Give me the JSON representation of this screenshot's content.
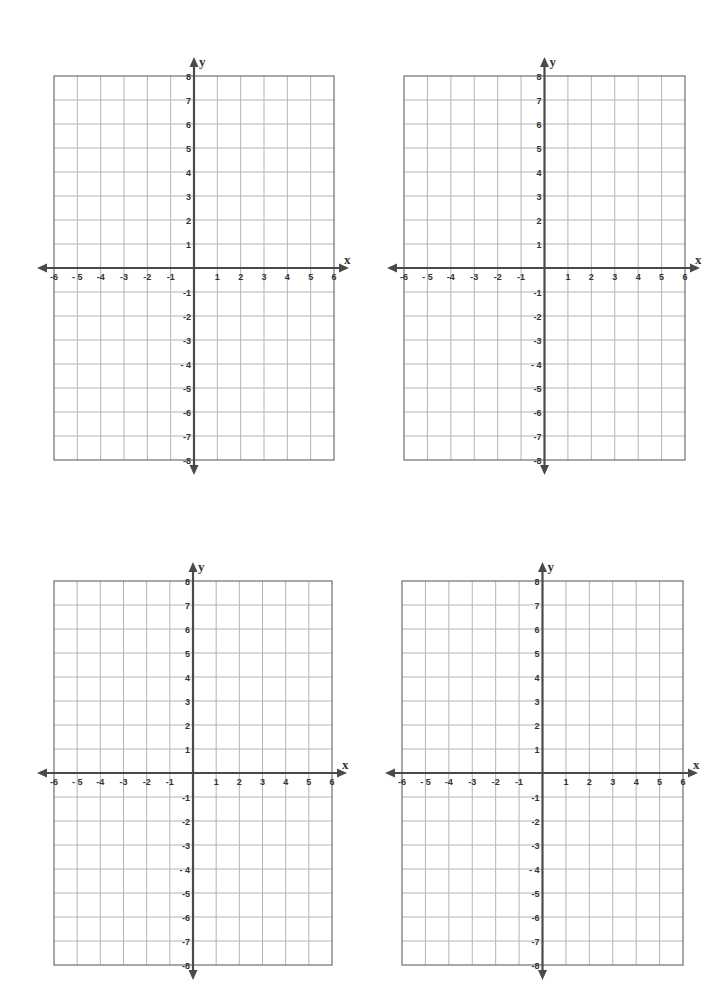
{
  "page": {
    "background": "#ffffff"
  },
  "style": {
    "grid_color": "#b4b4b4",
    "border_color": "#6e6e6e",
    "axis_color": "#4a4a4a",
    "label_color": "#333333"
  },
  "axes": {
    "x_label": "x",
    "y_label": "y",
    "x_min": -6,
    "x_max": 6,
    "y_min": -8,
    "y_max": 8,
    "x_ticks": [
      "-6",
      "- 5",
      "-4",
      "-3",
      "-2",
      "-1",
      "1",
      "2",
      "3",
      "4",
      "5",
      "6"
    ],
    "y_ticks_positive": [
      "8",
      "7",
      "6",
      "5",
      "4",
      "3",
      "2",
      "1"
    ],
    "y_ticks_negative": [
      "-1",
      "-2",
      "-3",
      "- 4",
      "-5",
      "-6",
      "-7",
      "-8"
    ]
  },
  "planes": [
    {
      "id": "plane-top-left",
      "left": 54,
      "top": 76,
      "right": 334,
      "bottom": 460
    },
    {
      "id": "plane-top-right",
      "left": 404,
      "top": 76,
      "right": 685,
      "bottom": 460
    },
    {
      "id": "plane-bottom-left",
      "left": 54,
      "top": 581,
      "right": 332,
      "bottom": 965
    },
    {
      "id": "plane-bottom-right",
      "left": 402,
      "top": 581,
      "right": 683,
      "bottom": 965
    }
  ],
  "chart_data": [
    {
      "type": "scatter",
      "title": "",
      "xlabel": "x",
      "ylabel": "y",
      "xlim": [
        -6,
        6
      ],
      "ylim": [
        -8,
        8
      ],
      "grid": true,
      "x_ticks": [
        -6,
        -5,
        -4,
        -3,
        -2,
        -1,
        1,
        2,
        3,
        4,
        5,
        6
      ],
      "y_ticks": [
        -8,
        -7,
        -6,
        -5,
        -4,
        -3,
        -2,
        -1,
        1,
        2,
        3,
        4,
        5,
        6,
        7,
        8
      ],
      "series": [],
      "position": "top-left"
    },
    {
      "type": "scatter",
      "title": "",
      "xlabel": "x",
      "ylabel": "y",
      "xlim": [
        -6,
        6
      ],
      "ylim": [
        -8,
        8
      ],
      "grid": true,
      "x_ticks": [
        -6,
        -5,
        -4,
        -3,
        -2,
        -1,
        1,
        2,
        3,
        4,
        5,
        6
      ],
      "y_ticks": [
        -8,
        -7,
        -6,
        -5,
        -4,
        -3,
        -2,
        -1,
        1,
        2,
        3,
        4,
        5,
        6,
        7,
        8
      ],
      "series": [],
      "position": "top-right"
    },
    {
      "type": "scatter",
      "title": "",
      "xlabel": "x",
      "ylabel": "y",
      "xlim": [
        -6,
        6
      ],
      "ylim": [
        -8,
        8
      ],
      "grid": true,
      "x_ticks": [
        -6,
        -5,
        -4,
        -3,
        -2,
        -1,
        1,
        2,
        3,
        4,
        5,
        6
      ],
      "y_ticks": [
        -8,
        -7,
        -6,
        -5,
        -4,
        -3,
        -2,
        -1,
        1,
        2,
        3,
        4,
        5,
        6,
        7,
        8
      ],
      "series": [],
      "position": "bottom-left"
    },
    {
      "type": "scatter",
      "title": "",
      "xlabel": "x",
      "ylabel": "y",
      "xlim": [
        -6,
        6
      ],
      "ylim": [
        -8,
        8
      ],
      "grid": true,
      "x_ticks": [
        -6,
        -5,
        -4,
        -3,
        -2,
        -1,
        1,
        2,
        3,
        4,
        5,
        6
      ],
      "y_ticks": [
        -8,
        -7,
        -6,
        -5,
        -4,
        -3,
        -2,
        -1,
        1,
        2,
        3,
        4,
        5,
        6,
        7,
        8
      ],
      "series": [],
      "position": "bottom-right"
    }
  ]
}
